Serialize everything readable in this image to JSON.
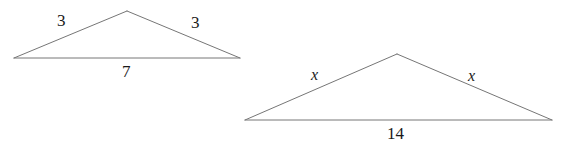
{
  "figure": {
    "background_color": "#ffffff",
    "stroke_color": "#767676",
    "text_color": "#1a1a1a",
    "stroke_width": 1,
    "width": 572,
    "height": 146
  },
  "triangles": [
    {
      "id": "left-triangle",
      "name": "small-triangle",
      "vertices": {
        "left": {
          "x": 14,
          "y": 58
        },
        "apex": {
          "x": 127,
          "y": 11
        },
        "right": {
          "x": 240,
          "y": 58
        }
      },
      "labels": {
        "left_side": "3",
        "right_side": "3",
        "base": "7"
      }
    },
    {
      "id": "right-triangle",
      "name": "large-triangle",
      "vertices": {
        "left": {
          "x": 245,
          "y": 120
        },
        "apex": {
          "x": 397,
          "y": 54
        },
        "right": {
          "x": 552,
          "y": 120
        }
      },
      "labels": {
        "left_side": "x",
        "right_side": "x",
        "base": "14"
      }
    }
  ]
}
